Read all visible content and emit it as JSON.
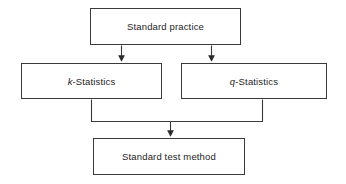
{
  "diagram": {
    "background_color": "#ffffff",
    "line_color": "#3a3a3a",
    "text_color": "#1d1d1d",
    "nodes": [
      {
        "id": "standard-practice",
        "label": "Standard practice",
        "shape": "rectangle"
      },
      {
        "id": "k-statistics",
        "label_prefix": "k",
        "label_suffix": "-Statistics",
        "label": "k-Statistics",
        "shape": "rectangle"
      },
      {
        "id": "q-statistics",
        "label_prefix": "q",
        "label_suffix": "-Statistics",
        "label": "q-Statistics",
        "shape": "rectangle"
      },
      {
        "id": "standard-test-method",
        "label": "Standard test method",
        "shape": "rectangle"
      }
    ],
    "edges": [
      {
        "id": "edge-practice-to-k",
        "from": "standard-practice",
        "to": "k-statistics",
        "arrow": "down"
      },
      {
        "id": "edge-practice-to-q",
        "from": "standard-practice",
        "to": "q-statistics",
        "arrow": "down"
      },
      {
        "id": "edge-k-to-method",
        "from": "k-statistics",
        "to": "standard-test-method",
        "arrow": "down"
      },
      {
        "id": "edge-q-to-method",
        "from": "q-statistics",
        "to": "standard-test-method",
        "arrow": "down"
      }
    ]
  }
}
